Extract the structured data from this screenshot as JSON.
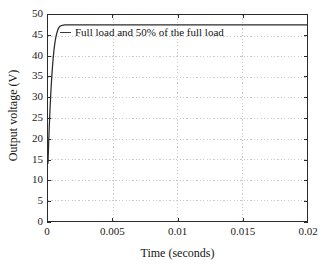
{
  "chart_data": {
    "type": "line",
    "title": "",
    "xlabel": "Time (seconds)",
    "ylabel": "Output voltage (V)",
    "xlim": [
      0,
      0.02
    ],
    "ylim": [
      0,
      50
    ],
    "grid": true,
    "grid_style": "dotted",
    "legend_position": "upper-left-inside",
    "xticks": [
      0,
      0.005,
      0.01,
      0.015,
      0.02
    ],
    "xtick_labels": [
      "0",
      "0.005",
      "0.01",
      "0.015",
      "0.02"
    ],
    "yticks": [
      0,
      5,
      10,
      15,
      20,
      25,
      30,
      35,
      40,
      45,
      50
    ],
    "ytick_labels": [
      "0",
      "5",
      "10",
      "15",
      "20",
      "25",
      "30",
      "35",
      "40",
      "45",
      "50"
    ],
    "series": [
      {
        "name": "Full load and 50% of the full load",
        "color": "#2b2b2b",
        "x": [
          0,
          5e-05,
          0.0001,
          0.00015,
          0.0002,
          0.00025,
          0.0003,
          0.00035,
          0.0004,
          0.00045,
          0.0005,
          0.00055,
          0.0006,
          0.00065,
          0.0007,
          0.00075,
          0.0008,
          0.00085,
          0.0009,
          0.00095,
          0.001,
          0.0011,
          0.0012,
          0.0013,
          0.0014,
          0.0015,
          0.0016,
          0.0018,
          0.002,
          0.0025,
          0.003,
          0.004,
          0.005,
          0.006,
          0.008,
          0.01,
          0.012,
          0.014,
          0.016,
          0.018,
          0.02
        ],
        "y": [
          14.0,
          18.8,
          23.0,
          26.7,
          30.0,
          32.9,
          35.4,
          37.6,
          39.5,
          41.1,
          42.5,
          43.6,
          44.5,
          45.2,
          45.8,
          46.3,
          46.7,
          47.0,
          47.2,
          47.3,
          47.4,
          47.5,
          47.55,
          47.6,
          47.6,
          47.6,
          47.6,
          47.6,
          47.6,
          47.6,
          47.6,
          47.6,
          47.6,
          47.6,
          47.6,
          47.6,
          47.6,
          47.6,
          47.6,
          47.6,
          47.6
        ]
      }
    ],
    "annotations": []
  },
  "legend": {
    "entry_label": "Full load and 50% of the full load",
    "dash_icon": "line-dash-icon"
  },
  "axes": {
    "x_title": "Time (seconds)",
    "y_title": "Output voltage (V)"
  },
  "colors": {
    "curve": "#2b2b2b",
    "axis": "#2b2b2b",
    "grid": "#c9c9c9",
    "text": "#141414",
    "background": "#ffffff"
  }
}
